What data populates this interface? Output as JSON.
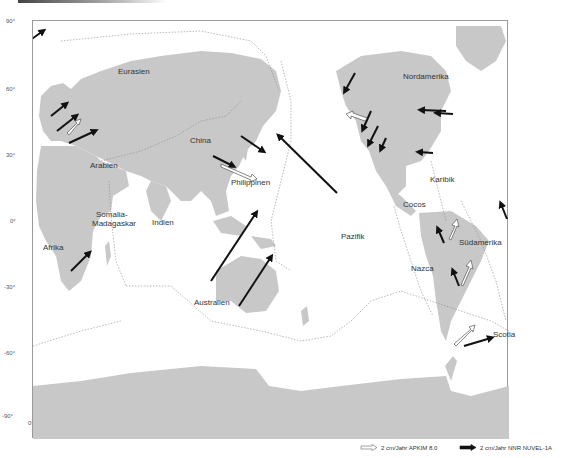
{
  "figure": {
    "type": "plate-motion-map",
    "projection": "equirectangular"
  },
  "axes": {
    "latitude_ticks": [
      "90°",
      "60°",
      "30°",
      "0°",
      "-30°",
      "-60°",
      "-90°"
    ],
    "longitude_ticks": [
      "0°",
      "60°",
      "120°",
      "180°",
      "240°",
      "300°"
    ]
  },
  "plates": {
    "eurasien": "Eurasien",
    "nordamerika": "Nordamerika",
    "china": "China",
    "arabien": "Arabien",
    "philippinen": "Philippinen",
    "karibik": "Karibik",
    "somalia": "Somalia-",
    "madagaskar": "Madagaskar",
    "indien": "Indien",
    "cocos": "Cocos",
    "afrika": "Afrika",
    "pazifik": "Pazifik",
    "suedamerika": "Südamerika",
    "nazca": "Nazca",
    "australien": "Australien",
    "scotia": "Scotia"
  },
  "legend": {
    "apkim": "2 cm/Jahr APKIM 8.0",
    "nuvel": "2 cm/Jahr NNR NUVEL-1A"
  },
  "colors": {
    "land": "#c8c8c8",
    "ocean": "#ffffff",
    "arrow_black": "#111111",
    "arrow_white_outline": "#555555",
    "boundary": "#8a8a8a"
  }
}
